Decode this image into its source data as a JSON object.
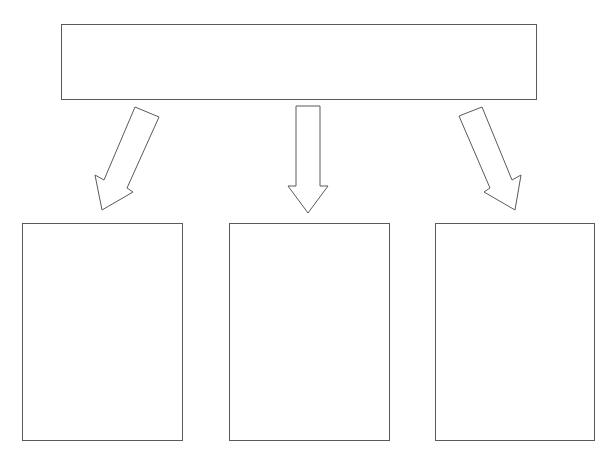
{
  "diagram": {
    "type": "hierarchy-one-to-three",
    "stroke_color": "#5a5a5a",
    "fill_color": "#ffffff",
    "background": "#ffffff",
    "top_box": {
      "label": ""
    },
    "arrows": [
      {
        "direction": "down-left"
      },
      {
        "direction": "down"
      },
      {
        "direction": "down-right"
      }
    ],
    "bottom_boxes": [
      {
        "label": ""
      },
      {
        "label": ""
      },
      {
        "label": ""
      }
    ]
  }
}
